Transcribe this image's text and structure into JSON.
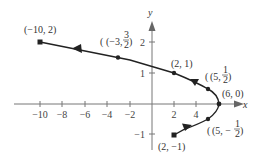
{
  "figure": {
    "x_axis_label": "x",
    "y_axis_label": "y",
    "x_ticks": [
      "−10",
      "−8",
      "−6",
      "−4",
      "−2",
      "2",
      "4"
    ],
    "y_ticks": [
      "2",
      "1",
      "−1"
    ],
    "points": [
      {
        "label": "(−10, 2)",
        "x": -10,
        "y": 2
      },
      {
        "label_main": "(−3,",
        "label_num": "3",
        "label_den": "2",
        "label_close": ")",
        "x": -3,
        "y": 1.5
      },
      {
        "label": "(2, 1)",
        "x": 2,
        "y": 1
      },
      {
        "label_main": "(5,",
        "label_num": "1",
        "label_den": "2",
        "label_close": ")",
        "x": 5,
        "y": 0.5
      },
      {
        "label": "(6, 0)",
        "x": 6,
        "y": 0
      },
      {
        "label_main": "(5, −",
        "label_num": "1",
        "label_den": "2",
        "label_close": ")",
        "x": 5,
        "y": -0.5
      },
      {
        "label": "(2, −1)",
        "x": 2,
        "y": -1
      }
    ],
    "colors": {
      "curve": "#222222",
      "axis": "#777777",
      "text": "#333333"
    }
  }
}
